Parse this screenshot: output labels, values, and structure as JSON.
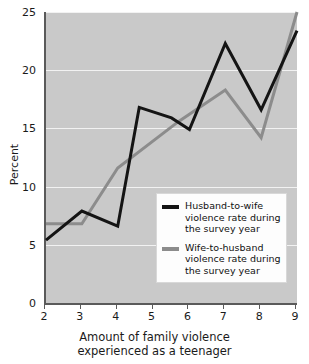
{
  "chart_data": {
    "type": "line",
    "title": "",
    "xlabel_lines": [
      "Amount of family violence",
      "experienced as a teenager"
    ],
    "xlabel": "Amount of family violence experienced as a teenager",
    "ylabel": "Percent",
    "xlim": [
      2,
      9
    ],
    "ylim": [
      0,
      25
    ],
    "grid": true,
    "xticks": [
      2,
      3,
      4,
      5,
      6,
      7,
      8,
      9
    ],
    "xtick_labels": [
      "2",
      "3",
      "4",
      "5",
      "6",
      "7",
      "8",
      "9"
    ],
    "yticks": [
      0,
      5,
      10,
      15,
      20,
      25
    ],
    "ytick_labels": [
      "0",
      "5",
      "10",
      "15",
      "20",
      "25"
    ],
    "legend_position": "center-right-inside",
    "plot_background": "#c9c9c9",
    "gridline_color": "#f2f2f2",
    "series": [
      {
        "name": "Husband-to-wife violence rate during the survey year",
        "legend_lines": [
          "Husband-to-wife",
          "violence rate during",
          "the survey year"
        ],
        "color": "#141414",
        "points": [
          {
            "x": 2.0,
            "y": 5.4
          },
          {
            "x": 3.0,
            "y": 7.9
          },
          {
            "x": 4.0,
            "y": 6.6
          },
          {
            "x": 4.6,
            "y": 16.8
          },
          {
            "x": 5.5,
            "y": 15.9
          },
          {
            "x": 6.0,
            "y": 14.9
          },
          {
            "x": 7.0,
            "y": 22.3
          },
          {
            "x": 8.0,
            "y": 16.6
          },
          {
            "x": 9.0,
            "y": 23.4
          }
        ]
      },
      {
        "name": "Wife-to-husband violence rate during the survey year",
        "legend_lines": [
          "Wife-to-husband",
          "violence rate during",
          "the survey year"
        ],
        "color": "#8c8c8c",
        "points": [
          {
            "x": 2.0,
            "y": 6.8
          },
          {
            "x": 3.0,
            "y": 6.8
          },
          {
            "x": 4.0,
            "y": 11.6
          },
          {
            "x": 5.7,
            "y": 15.6
          },
          {
            "x": 7.0,
            "y": 18.3
          },
          {
            "x": 8.0,
            "y": 14.2
          },
          {
            "x": 9.0,
            "y": 25.0
          }
        ]
      }
    ]
  }
}
